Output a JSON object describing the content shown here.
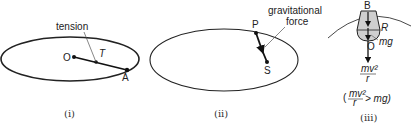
{
  "panels": [
    {
      "caption": "(i)",
      "labels": {
        "center": "O",
        "point": "A",
        "force_symbol": "T",
        "force_name": "tension"
      }
    },
    {
      "caption": "(ii)",
      "labels": {
        "point": "P",
        "focus": "S",
        "force_name_line1": "gravitational",
        "force_name_line2": "force"
      }
    },
    {
      "caption": "(iii)",
      "labels": {
        "top": "B",
        "reaction": "R",
        "weight": "mg",
        "center": "O",
        "centripetal_num": "mv²",
        "centripetal_den": "r",
        "condition_open": "(",
        "condition_num": "mv²",
        "condition_den": "r",
        "condition_rel": "> mg)"
      }
    }
  ]
}
